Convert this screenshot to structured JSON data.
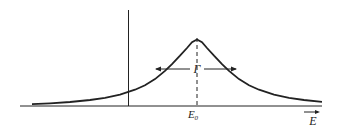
{
  "diagram": {
    "type": "resonance-curve",
    "peak_label": "E",
    "peak_label_subscript": "0",
    "width_label": "Γ",
    "x_axis_label": "E",
    "colors": {
      "stroke": "#222222",
      "background": "#ffffff"
    }
  }
}
